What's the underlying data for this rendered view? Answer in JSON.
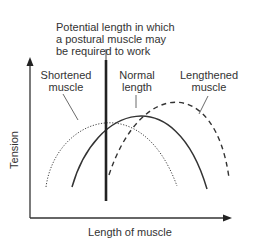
{
  "diagram": {
    "annotation": {
      "line1": "Potential length in which",
      "line2": "a postural muscle may",
      "line3": "be required to work"
    },
    "curves": [
      {
        "id": "shortened",
        "line1": "Shortened",
        "line2": "muscle",
        "style": "dotted"
      },
      {
        "id": "normal",
        "line1": "Normal",
        "line2": "length",
        "style": "solid"
      },
      {
        "id": "lengthened",
        "line1": "Lengthened",
        "line2": "muscle",
        "style": "dashed"
      }
    ],
    "axes": {
      "x_label": "Length of muscle",
      "y_label": "Tension"
    },
    "colors": {
      "ink": "#333333",
      "background": "#ffffff"
    }
  }
}
